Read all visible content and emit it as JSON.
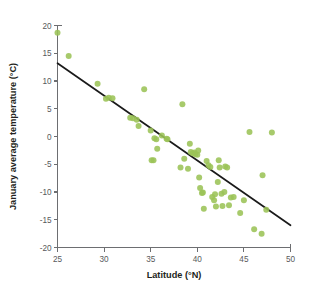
{
  "chart_data": {
    "type": "scatter",
    "title": "",
    "xlabel": "Latitude (°N)",
    "ylabel": "January average temperature (°C)",
    "xlim": [
      25,
      50
    ],
    "ylim": [
      -20,
      20
    ],
    "xticks": [
      25,
      30,
      35,
      40,
      45,
      50
    ],
    "yticks": [
      20,
      15,
      10,
      5,
      0,
      -5,
      -10,
      -15,
      -20
    ],
    "xtick_labels": [
      "25",
      "30",
      "35",
      "40",
      "45",
      "50"
    ],
    "ytick_labels": [
      "20",
      "15",
      "10",
      "5",
      "0",
      "-5",
      "-10",
      "-15",
      "-20"
    ],
    "grid": false,
    "legend": null,
    "point_color": "#9bc356",
    "line_color": "#1a1a1a",
    "axis_color": "#6d6e71",
    "trend_line": {
      "label": "least-squares regression line",
      "x": [
        25,
        50
      ],
      "y": [
        13.2,
        -16.0
      ],
      "slope": -1.168,
      "intercept": 42.4
    },
    "points": [
      [
        25.0,
        18.7
      ],
      [
        26.2,
        14.5
      ],
      [
        29.3,
        9.5
      ],
      [
        30.2,
        6.8
      ],
      [
        30.5,
        7.0
      ],
      [
        30.9,
        6.9
      ],
      [
        32.8,
        3.4
      ],
      [
        33.1,
        3.3
      ],
      [
        33.5,
        3.0
      ],
      [
        33.7,
        1.9
      ],
      [
        34.3,
        8.5
      ],
      [
        35.0,
        1.1
      ],
      [
        35.1,
        -4.3
      ],
      [
        35.3,
        -4.3
      ],
      [
        35.4,
        -0.3
      ],
      [
        35.6,
        -0.5
      ],
      [
        35.7,
        -2.2
      ],
      [
        36.2,
        0.2
      ],
      [
        36.7,
        -0.4
      ],
      [
        36.8,
        -0.5
      ],
      [
        38.2,
        -5.6
      ],
      [
        38.4,
        5.8
      ],
      [
        38.6,
        -4.0
      ],
      [
        39.0,
        -5.8
      ],
      [
        39.2,
        -1.3
      ],
      [
        39.3,
        -2.8
      ],
      [
        39.5,
        -3.0
      ],
      [
        39.7,
        -2.9
      ],
      [
        39.8,
        -3.2
      ],
      [
        40.0,
        -3.3
      ],
      [
        40.1,
        -2.5
      ],
      [
        40.2,
        -7.4
      ],
      [
        40.3,
        -9.3
      ],
      [
        40.5,
        -10.2
      ],
      [
        40.6,
        -10.1
      ],
      [
        40.7,
        -13.0
      ],
      [
        41.0,
        -4.4
      ],
      [
        41.2,
        -5.2
      ],
      [
        41.4,
        -5.5
      ],
      [
        41.6,
        -10.9
      ],
      [
        41.8,
        -11.5
      ],
      [
        41.9,
        -10.4
      ],
      [
        42.0,
        -12.6
      ],
      [
        42.2,
        -8.2
      ],
      [
        42.3,
        -4.3
      ],
      [
        42.4,
        -5.6
      ],
      [
        42.6,
        -10.3
      ],
      [
        42.7,
        -12.5
      ],
      [
        42.9,
        -10.0
      ],
      [
        43.0,
        -5.4
      ],
      [
        43.2,
        -5.6
      ],
      [
        43.4,
        -12.4
      ],
      [
        43.6,
        -11.0
      ],
      [
        43.9,
        -10.9
      ],
      [
        44.6,
        -13.8
      ],
      [
        45.0,
        -11.5
      ],
      [
        45.6,
        0.8
      ],
      [
        46.1,
        -16.7
      ],
      [
        46.9,
        -17.5
      ],
      [
        47.0,
        -7.0
      ],
      [
        47.4,
        -13.2
      ],
      [
        48.0,
        0.7
      ]
    ]
  }
}
